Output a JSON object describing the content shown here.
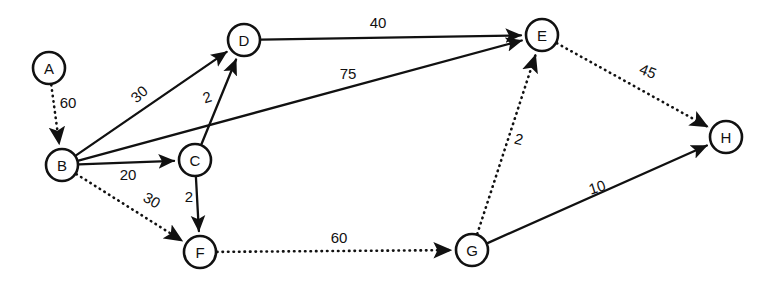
{
  "diagram": {
    "type": "directed-weighted-graph",
    "width": 766,
    "height": 284,
    "background_color": "#ffffff",
    "stroke_color": "#111111",
    "node_radius": 16,
    "nodes": [
      {
        "id": "A",
        "label": "A",
        "x": 49,
        "y": 68
      },
      {
        "id": "B",
        "label": "B",
        "x": 62,
        "y": 165
      },
      {
        "id": "C",
        "label": "C",
        "x": 195,
        "y": 160
      },
      {
        "id": "D",
        "label": "D",
        "x": 244,
        "y": 40
      },
      {
        "id": "E",
        "label": "E",
        "x": 542,
        "y": 35
      },
      {
        "id": "F",
        "label": "F",
        "x": 200,
        "y": 252
      },
      {
        "id": "G",
        "label": "G",
        "x": 472,
        "y": 250
      },
      {
        "id": "H",
        "label": "H",
        "x": 726,
        "y": 137
      }
    ],
    "edges": [
      {
        "id": "A-B",
        "from": "A",
        "to": "B",
        "weight": "60",
        "style": "dotted",
        "label_x": 68,
        "label_y": 102,
        "label_rotate": 0
      },
      {
        "id": "B-D",
        "from": "B",
        "to": "D",
        "weight": "30",
        "style": "solid",
        "label_x": 139,
        "label_y": 94,
        "label_rotate": -42
      },
      {
        "id": "B-C",
        "from": "B",
        "to": "C",
        "weight": "20",
        "style": "solid",
        "label_x": 128,
        "label_y": 174,
        "label_rotate": 0
      },
      {
        "id": "B-E",
        "from": "B",
        "to": "E",
        "weight": "75",
        "style": "solid",
        "label_x": 348,
        "label_y": 73,
        "label_rotate": 0
      },
      {
        "id": "B-F",
        "from": "B",
        "to": "F",
        "weight": "30",
        "style": "dotted",
        "label_x": 152,
        "label_y": 200,
        "label_rotate": 30
      },
      {
        "id": "C-D",
        "from": "C",
        "to": "D",
        "weight": "2",
        "style": "solid",
        "label_x": 207,
        "label_y": 97,
        "label_rotate": -18
      },
      {
        "id": "C-F",
        "from": "C",
        "to": "F",
        "weight": "2",
        "style": "solid",
        "label_x": 189,
        "label_y": 196,
        "label_rotate": 0
      },
      {
        "id": "D-E",
        "from": "D",
        "to": "E",
        "weight": "40",
        "style": "solid",
        "label_x": 378,
        "label_y": 22,
        "label_rotate": 0
      },
      {
        "id": "E-H",
        "from": "E",
        "to": "H",
        "weight": "45",
        "style": "dotted",
        "label_x": 648,
        "label_y": 71,
        "label_rotate": 22
      },
      {
        "id": "F-G",
        "from": "F",
        "to": "G",
        "weight": "60",
        "style": "dotted",
        "label_x": 339,
        "label_y": 237,
        "label_rotate": 0
      },
      {
        "id": "G-E",
        "from": "G",
        "to": "E",
        "weight": "2",
        "style": "dotted",
        "label_x": 519,
        "label_y": 139,
        "label_rotate": 14
      },
      {
        "id": "G-H",
        "from": "G",
        "to": "H",
        "weight": "10",
        "style": "solid",
        "label_x": 597,
        "label_y": 187,
        "label_rotate": -18
      }
    ]
  }
}
